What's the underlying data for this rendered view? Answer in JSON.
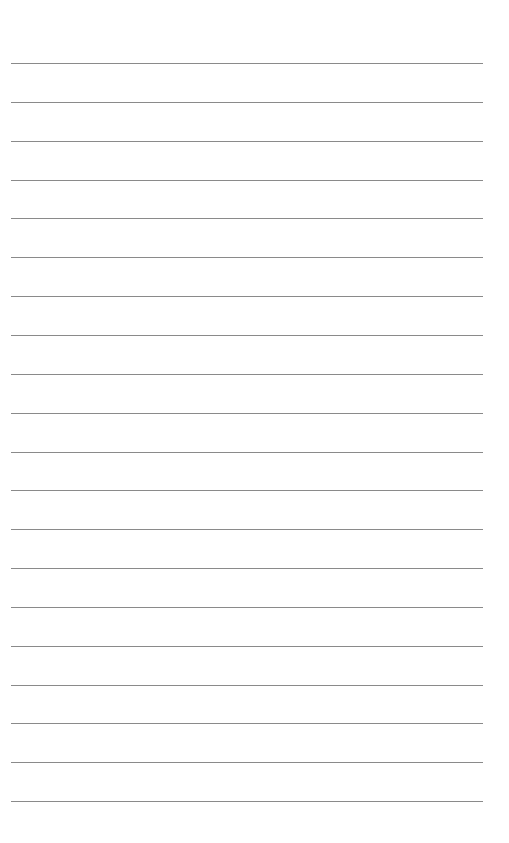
{
  "page": {
    "type": "blank-lined-sheet",
    "line_count": 20,
    "first_line_y": 63,
    "line_spacing": 38.85,
    "line_left": 11,
    "line_width": 472,
    "line_color": "#8a8a8a",
    "background": "#ffffff"
  }
}
